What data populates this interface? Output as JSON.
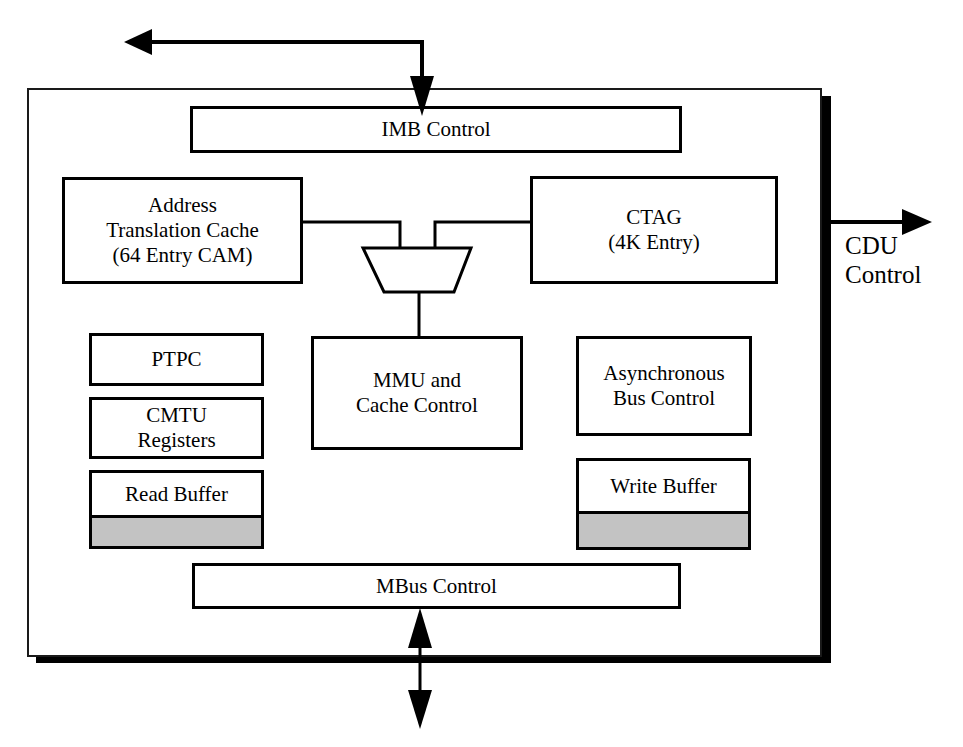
{
  "diagram": {
    "title_region": "CMTU block diagram",
    "outer_frame": {
      "name": "chip-boundary",
      "x": 27,
      "y": 88,
      "width": 795,
      "height": 569,
      "shadow_color": "#000000",
      "border_color": "#1a1a1a"
    },
    "blocks": [
      {
        "id": "imb_control",
        "label": "IMB Control",
        "x": 190,
        "y": 106,
        "w": 492,
        "h": 47
      },
      {
        "id": "atc",
        "label": "Address\nTranslation Cache\n(64 Entry CAM)",
        "x": 62,
        "y": 177,
        "w": 241,
        "h": 107
      },
      {
        "id": "ctag",
        "label": "CTAG\n(4K Entry)",
        "x": 530,
        "y": 176,
        "w": 248,
        "h": 108
      },
      {
        "id": "ptpc",
        "label": "PTPC",
        "x": 89,
        "y": 333,
        "w": 175,
        "h": 53
      },
      {
        "id": "cmtu_registers",
        "label": "CMTU\nRegisters",
        "x": 89,
        "y": 397,
        "w": 175,
        "h": 62
      },
      {
        "id": "mmu_cache",
        "label": "MMU and\nCache Control",
        "x": 311,
        "y": 336,
        "w": 212,
        "h": 114
      },
      {
        "id": "async_bus",
        "label": "Asynchronous\nBus Control",
        "x": 576,
        "y": 336,
        "w": 176,
        "h": 100
      },
      {
        "id": "mbus_control",
        "label": "MBus Control",
        "x": 192,
        "y": 563,
        "w": 489,
        "h": 46
      }
    ],
    "buffers": [
      {
        "id": "read_buffer",
        "label": "Read Buffer",
        "x": 89,
        "y": 470,
        "w": 175,
        "h": 79,
        "label_h": 42,
        "fill_color": "#c3c3c3"
      },
      {
        "id": "write_buffer",
        "label": "Write Buffer",
        "x": 576,
        "y": 458,
        "w": 175,
        "h": 92,
        "label_h": 50,
        "fill_color": "#c3c3c3"
      }
    ],
    "mux": {
      "id": "address_mux",
      "name": "multiplexer",
      "top_left_x": 363,
      "top_right_x": 471,
      "bottom_left_x": 384,
      "bottom_right_x": 454,
      "top_y": 248,
      "bottom_y": 292
    },
    "external_labels": [
      {
        "id": "cdu_control",
        "label": "CDU\nControl",
        "x": 845,
        "y": 232
      }
    ],
    "arrows": [
      {
        "id": "imb_in_out",
        "description": "L-shaped bus from IMB Control up and out to the left",
        "points": "422,108 422,42 128,42",
        "head_at": "left",
        "second_head_at": "down"
      },
      {
        "id": "cdu_control_out",
        "description": "Right-pointing arrow exiting chip boundary to CDU",
        "from_x": 826,
        "to_x": 932,
        "y": 222
      },
      {
        "id": "mbus_bidirectional",
        "description": "Bidirectional arrow from MBus Control crossing the bottom boundary",
        "x": 420,
        "top_y": 610,
        "bottom_y": 727
      }
    ],
    "connections": [
      {
        "id": "atc-to-mux",
        "description": "Address Translation Cache right edge to mux left input"
      },
      {
        "id": "ctag-to-mux",
        "description": "CTAG left edge to mux right input"
      },
      {
        "id": "mux-to-mmu",
        "description": "Mux output down to MMU and Cache Control"
      }
    ]
  }
}
